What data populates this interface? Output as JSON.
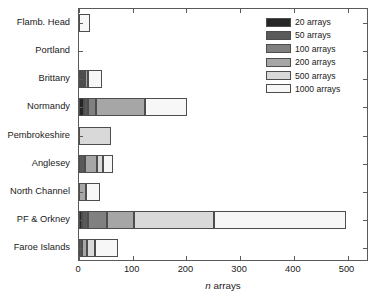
{
  "chart_data": {
    "type": "bar",
    "orientation": "horizontal",
    "stacked": true,
    "title": "",
    "xlabel": "n arrays",
    "xlabel_italic_part": "n",
    "xlabel_rest": " arrays",
    "ylabel": "",
    "xlim": [
      0,
      540
    ],
    "ylim_categories": 9,
    "grid": false,
    "legend_position": "top-right",
    "xticks": [
      0,
      100,
      200,
      300,
      400,
      500
    ],
    "xtick_labels": [
      "0",
      "100",
      "200",
      "300",
      "400",
      "500"
    ],
    "categories": [
      "Flamb. Head",
      "Portland",
      "Brittany",
      "Normandy",
      "Pembrokeshire",
      "Anglesey",
      "North Channel",
      "PF & Orkney",
      "Faroe Islands"
    ],
    "series": [
      {
        "name": "20 arrays",
        "color": "#262626",
        "values": [
          0,
          0,
          4,
          10,
          0,
          0,
          0,
          5,
          0
        ]
      },
      {
        "name": "50 arrays",
        "color": "#595959",
        "values": [
          0,
          0,
          3,
          7,
          0,
          11,
          0,
          12,
          5
        ]
      },
      {
        "name": "100 arrays",
        "color": "#808080",
        "values": [
          0,
          0,
          5,
          15,
          0,
          0,
          0,
          35,
          0
        ]
      },
      {
        "name": "200 arrays",
        "color": "#a6a6a6",
        "values": [
          0,
          0,
          5,
          90,
          0,
          23,
          13,
          50,
          9
        ]
      },
      {
        "name": "500 arrays",
        "color": "#d9d9d9",
        "values": [
          0,
          0,
          0,
          0,
          60,
          11,
          0,
          150,
          16
        ]
      },
      {
        "name": "1000 arrays",
        "color": "#f7f7f7",
        "values": [
          20,
          0,
          25,
          80,
          0,
          19,
          26,
          245,
          42
        ]
      }
    ],
    "totals": [
      20,
      0,
      42,
      202,
      60,
      64,
      39,
      497,
      72
    ],
    "legend_entries": [
      {
        "label": "20 arrays",
        "color": "#262626"
      },
      {
        "label": "50 arrays",
        "color": "#595959"
      },
      {
        "label": "100 arrays",
        "color": "#808080"
      },
      {
        "label": "200 arrays",
        "color": "#a6a6a6"
      },
      {
        "label": "500 arrays",
        "color": "#d9d9d9"
      },
      {
        "label": "1000 arrays",
        "color": "#f7f7f7"
      }
    ],
    "axis_color": "#5a5a5a",
    "bar_edge_color": "#4d4d4d",
    "text_color": "#1a1a1a"
  }
}
